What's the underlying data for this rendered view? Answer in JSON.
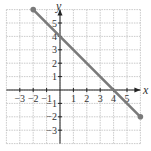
{
  "chart_data": {
    "type": "line",
    "title": "",
    "xlabel": "x",
    "ylabel": "y",
    "xlim": [
      -4,
      6
    ],
    "ylim": [
      -4,
      6
    ],
    "grid": true,
    "x_ticks": [
      -3,
      -2,
      -1,
      1,
      2,
      3,
      4,
      5
    ],
    "y_ticks": [
      -3,
      -2,
      -1,
      1,
      2,
      3,
      4,
      5
    ],
    "x_tick_labels": [
      "−3",
      "−2",
      "−1",
      "1",
      "2",
      "3",
      "4",
      "5"
    ],
    "y_tick_labels": [
      "−3",
      "−2",
      "−1",
      "1",
      "2",
      "3",
      "4",
      "5"
    ],
    "series": [
      {
        "name": "line segment",
        "x": [
          -2,
          6
        ],
        "y": [
          6,
          -2
        ],
        "color": "#7a7a7a",
        "endpoints": "filled"
      }
    ],
    "annotations": {
      "y_intercept": [
        0,
        4
      ],
      "x_intercept": [
        4,
        0
      ]
    },
    "colors": {
      "grid": "#bdbdbd",
      "axis": "#222222",
      "line": "#7a7a7a"
    }
  }
}
